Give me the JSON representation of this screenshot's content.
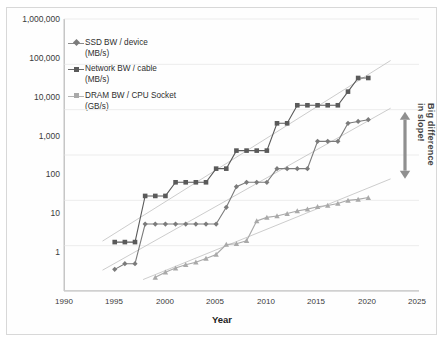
{
  "chart_data": {
    "type": "line",
    "title": "",
    "xlabel": "Year",
    "ylabel": "",
    "yscale": "log",
    "ylim": [
      1,
      1000000
    ],
    "xlim": [
      1990,
      2025
    ],
    "grid": true,
    "legend_position": "upper-left",
    "ytick_labels": [
      "1,000,000",
      "100,000",
      "10,000",
      "1,000",
      "100",
      "10",
      "1"
    ],
    "ytick_values": [
      1000000,
      100000,
      10000,
      1000,
      100,
      10,
      1
    ],
    "xtick_labels": [
      "1990",
      "1995",
      "2000",
      "2005",
      "2010",
      "2015",
      "2020",
      "2025"
    ],
    "xtick_values": [
      1990,
      1995,
      2000,
      2005,
      2010,
      2015,
      2020,
      2025
    ],
    "annotations": [
      {
        "text": "Big difference in slope!",
        "line1": "Big difference",
        "line2": "in slope!",
        "kind": "double-headed-arrow",
        "orientation": "vertical"
      }
    ],
    "series": [
      {
        "name": "SSD BW / device",
        "unit": "(MB/s)",
        "color": "#7b7b7b",
        "marker": "diamond",
        "trendline": true,
        "x": [
          1995,
          1996,
          1997,
          1998,
          1999,
          2000,
          2001,
          2002,
          2003,
          2004,
          2005,
          2006,
          2007,
          2008,
          2009,
          2010,
          2011,
          2012,
          2013,
          2014,
          2015,
          2016,
          2017,
          2018,
          2019,
          2020
        ],
        "values": [
          3,
          4,
          4,
          30,
          30,
          30,
          30,
          30,
          30,
          30,
          30,
          70,
          200,
          250,
          250,
          250,
          500,
          500,
          500,
          500,
          2000,
          2000,
          2000,
          5000,
          5500,
          6000
        ]
      },
      {
        "name": "Network BW / cable",
        "unit": "(MB/s)",
        "color": "#5a5a5a",
        "marker": "square",
        "trendline": true,
        "x": [
          1995,
          1996,
          1997,
          1998,
          1999,
          2000,
          2001,
          2002,
          2003,
          2004,
          2005,
          2006,
          2007,
          2008,
          2009,
          2010,
          2011,
          2012,
          2013,
          2014,
          2015,
          2016,
          2017,
          2018,
          2019,
          2020
        ],
        "values": [
          12,
          12,
          12,
          125,
          125,
          125,
          250,
          250,
          250,
          250,
          500,
          500,
          1250,
          1250,
          1250,
          1250,
          5000,
          5000,
          12500,
          12500,
          12500,
          12500,
          12500,
          25000,
          50000,
          50000
        ]
      },
      {
        "name": "DRAM BW / CPU Socket",
        "unit": "(GB/s)",
        "color": "#a9a9a9",
        "marker": "triangle",
        "trendline": true,
        "x": [
          1999,
          2000,
          2001,
          2002,
          2003,
          2004,
          2005,
          2006,
          2007,
          2008,
          2009,
          2010,
          2011,
          2012,
          2013,
          2014,
          2015,
          2016,
          2017,
          2018,
          2019,
          2020
        ],
        "values": [
          2,
          2.6,
          3.2,
          3.8,
          4.3,
          5.2,
          6.4,
          10.6,
          11,
          12.8,
          35,
          42,
          45,
          51,
          58,
          64,
          72,
          77,
          85,
          100,
          105,
          115
        ]
      }
    ]
  },
  "legend": {
    "items": [
      {
        "label": "SSD BW / device",
        "unit": "(MB/s)"
      },
      {
        "label": "Network BW / cable",
        "unit": "(MB/s)"
      },
      {
        "label": "DRAM BW / CPU Socket",
        "unit": "(GB/s)"
      }
    ]
  },
  "axis": {
    "x_title": "Year"
  }
}
